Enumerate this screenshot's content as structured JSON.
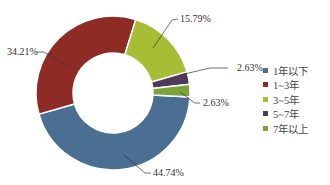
{
  "chart_data": {
    "type": "pie",
    "donut": true,
    "title": "",
    "categories": [
      "1年以下",
      "1~3年",
      "3~5年",
      "5~7年",
      "7年以上"
    ],
    "values": [
      44.74,
      34.21,
      15.79,
      2.63,
      2.63
    ],
    "value_labels": [
      "44.74%",
      "34.21%",
      "15.79%",
      "2.63%",
      "2.63%"
    ],
    "colors": [
      "#4a6f92",
      "#8e2b24",
      "#a9bc35",
      "#4d3a5c",
      "#7aa33a"
    ],
    "start_angle_deg": 3,
    "direction": "clockwise",
    "legend_position": "right"
  },
  "legend": {
    "items": [
      {
        "label": "1年以下",
        "color": "#4a6f92"
      },
      {
        "label": "1~3年",
        "color": "#8e2b24"
      },
      {
        "label": "3~5年",
        "color": "#a9bc35"
      },
      {
        "label": "5~7年",
        "color": "#4d3a5c"
      },
      {
        "label": "7年以上",
        "color": "#7aa33a"
      }
    ]
  },
  "labels": {
    "l0": "44.74%",
    "l1": "34.21%",
    "l2": "15.79%",
    "l3": "2.63%",
    "l4": "2.63%"
  }
}
